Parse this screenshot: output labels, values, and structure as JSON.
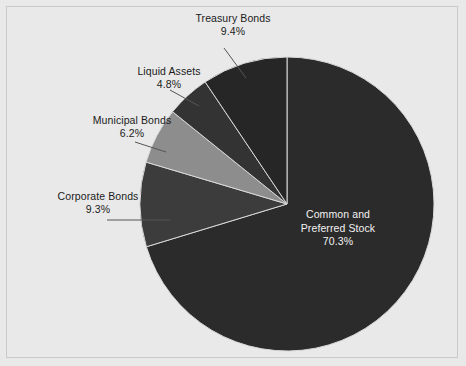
{
  "chart_data": {
    "type": "pie",
    "title": "",
    "subtitle": "",
    "xlabel": "",
    "ylabel": "",
    "legend_position": "none",
    "grid": false,
    "units": "percent",
    "start_angle_deg": 0,
    "direction": "clockwise",
    "categories": [
      "Common and Preferred Stock",
      "Corporate Bonds",
      "Municipal Bonds",
      "Liquid Assets",
      "Treasury Bonds"
    ],
    "values": [
      70.3,
      9.3,
      6.2,
      4.8,
      9.4
    ],
    "slices": [
      {
        "name": "Common and Preferred Stock",
        "label_line_1": "Common and",
        "label_line_2": "Preferred Stock",
        "value": 70.3,
        "value_text": "70.3%",
        "color": "#2b2b2b",
        "label_placement": "inside",
        "label_color": "#f2f2f2"
      },
      {
        "name": "Corporate Bonds",
        "label": "Corporate Bonds",
        "value": 9.3,
        "value_text": "9.3%",
        "color": "#3c3c3c",
        "label_placement": "outside",
        "label_color": "#1b1b1b",
        "leader_line": true
      },
      {
        "name": "Municipal Bonds",
        "label": "Municipal Bonds",
        "value": 6.2,
        "value_text": "6.2%",
        "color": "#8d8d8d",
        "label_placement": "outside",
        "label_color": "#1b1b1b",
        "leader_line": true
      },
      {
        "name": "Liquid Assets",
        "label": "Liquid Assets",
        "value": 4.8,
        "value_text": "4.8%",
        "color": "#333333",
        "label_placement": "outside",
        "label_color": "#1b1b1b",
        "leader_line": true
      },
      {
        "name": "Treasury Bonds",
        "label": "Treasury Bonds",
        "value": 9.4,
        "value_text": "9.4%",
        "color": "#262626",
        "label_placement": "outside",
        "label_color": "#1b1b1b",
        "leader_line": true
      }
    ]
  },
  "canvas": {
    "background_color": "#e9e9e9",
    "border_color": "#c9c9c9",
    "slice_edge_color": "#d8d8d8",
    "leader_line_color": "#555555"
  }
}
